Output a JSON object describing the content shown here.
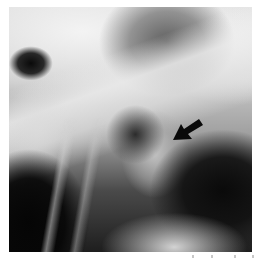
{
  "image": {
    "type": "radiograph",
    "description": "Grayscale X-ray with annotation arrow",
    "colors": {
      "background": "#ffffff",
      "arrow": "#0a0a0a"
    }
  },
  "annotation": {
    "icon": "arrow-icon",
    "direction": "down-left"
  }
}
